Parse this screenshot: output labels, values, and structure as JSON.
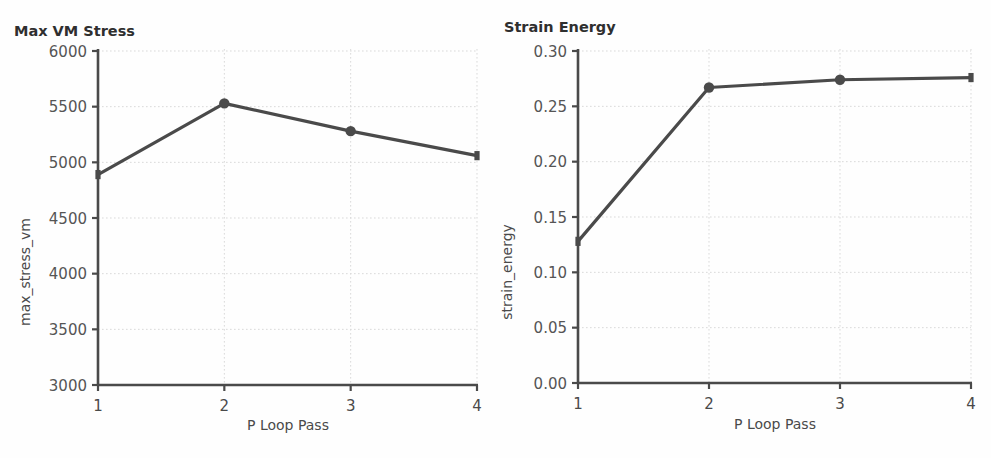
{
  "chart_data": [
    {
      "type": "line",
      "title": "Max VM Stress",
      "xlabel": "P Loop Pass",
      "ylabel": "max_stress_vm",
      "x": [
        1,
        2,
        3,
        4
      ],
      "categories": [
        "1",
        "2",
        "3",
        "4"
      ],
      "values": [
        4890,
        5530,
        5280,
        5060
      ],
      "xtick_labels": [
        "1",
        "2",
        "3",
        "4"
      ],
      "ytick_labels": [
        "3000",
        "3500",
        "4000",
        "4500",
        "5000",
        "5500",
        "6000"
      ],
      "ytick_values": [
        3000,
        3500,
        4000,
        4500,
        5000,
        5500,
        6000
      ],
      "xlim": [
        1,
        4
      ],
      "ylim": [
        3000,
        6000
      ],
      "grid": true,
      "legend": "none",
      "series_color": "#4a4a4a",
      "marker": "circle"
    },
    {
      "type": "line",
      "title": "Strain Energy",
      "xlabel": "P Loop Pass",
      "ylabel": "strain_energy",
      "x": [
        1,
        2,
        3,
        4
      ],
      "categories": [
        "1",
        "2",
        "3",
        "4"
      ],
      "values": [
        0.128,
        0.267,
        0.274,
        0.276
      ],
      "xtick_labels": [
        "1",
        "2",
        "3",
        "4"
      ],
      "ytick_labels": [
        "0.00",
        "0.05",
        "0.10",
        "0.15",
        "0.20",
        "0.25",
        "0.30"
      ],
      "ytick_values": [
        0.0,
        0.05,
        0.1,
        0.15,
        0.2,
        0.25,
        0.3
      ],
      "xlim": [
        1,
        4
      ],
      "ylim": [
        0.0,
        0.3
      ],
      "grid": true,
      "legend": "none",
      "series_color": "#4a4a4a",
      "marker": "circle"
    }
  ],
  "colors": {
    "series": "#4a4a4a",
    "axis": "#4a4a4a",
    "grid": "#d9d9d9",
    "text": "#4a4a4a",
    "background": "#fefefe"
  }
}
